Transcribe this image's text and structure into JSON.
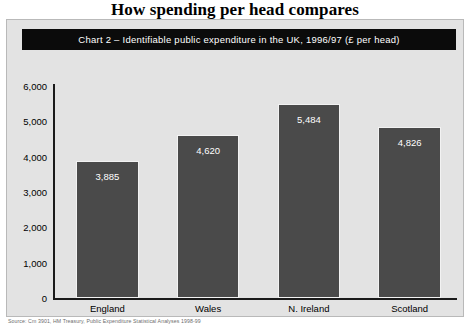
{
  "headline": "How spending per head compares",
  "banner": "Chart 2 – Identifiable public expenditure in the UK, 1996/97 (£ per head)",
  "source": "Source: Cm 3901, HM Treasury, Public Expenditure Statistical Analyses 1998-99",
  "colors": {
    "bar_fill": "#4a4a4a",
    "bar_outline": "#f2f2f2",
    "banner_background": "#0b0b0b",
    "banner_text": "#ffffff",
    "figure_background": "#e3e3e3",
    "axis": "#1a1a1a"
  },
  "chart_data": {
    "type": "bar",
    "title": "Chart 2 – Identifiable public expenditure in the UK, 1996/97 (£ per head)",
    "xlabel": "",
    "ylabel": "",
    "categories": [
      "England",
      "Wales",
      "N. Ireland",
      "Scotland"
    ],
    "values": [
      3885,
      4620,
      5484,
      4826
    ],
    "value_labels": [
      "3,885",
      "4,620",
      "5,484",
      "4,826"
    ],
    "ylim": [
      0,
      6000
    ],
    "yticks": [
      0,
      1000,
      2000,
      3000,
      4000,
      5000,
      6000
    ],
    "ytick_labels": [
      "0",
      "1,000",
      "2,000",
      "3,000",
      "4,000",
      "5,000",
      "6,000"
    ],
    "grid": false,
    "legend": false
  }
}
